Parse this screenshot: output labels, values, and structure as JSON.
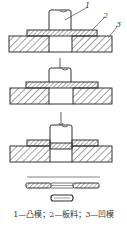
{
  "figure": {
    "caption": "1—凸模；2—板料；3—凹模",
    "labels": [
      {
        "id": "1",
        "text": "1",
        "meaning": "凸模"
      },
      {
        "id": "2",
        "text": "2",
        "meaning": "板料"
      },
      {
        "id": "3",
        "text": "3",
        "meaning": "凹模"
      }
    ],
    "stages": [
      {
        "name": "stage-1-contact"
      },
      {
        "name": "stage-2-press"
      },
      {
        "name": "stage-3-shear"
      },
      {
        "name": "stage-4-result"
      }
    ],
    "colors": {
      "line": "#333333",
      "hatch": "#555555",
      "background": "#ffffff"
    }
  }
}
